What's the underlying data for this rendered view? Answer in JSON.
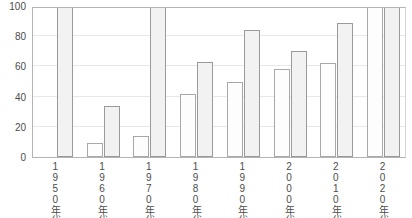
{
  "chart_data": {
    "type": "bar",
    "title": "",
    "subtitle": "",
    "xlabel": "",
    "ylabel": "",
    "ylim": [
      0,
      100
    ],
    "yticks": [
      0,
      20,
      40,
      60,
      80,
      100
    ],
    "grid": true,
    "legend": "none",
    "categories": [
      "1950年代",
      "1960年代",
      "1970年代",
      "1980年代",
      "1990年代",
      "2000年代",
      "2010年代",
      "2020年代"
    ],
    "series": [
      {
        "name": "series-a",
        "values": [
          null,
          9,
          14,
          42,
          50,
          58,
          62,
          100
        ]
      },
      {
        "name": "series-b",
        "values": [
          100,
          34,
          100,
          63,
          84,
          70,
          89,
          100
        ]
      }
    ]
  },
  "axis": {
    "y_tick_labels": [
      "100",
      "80",
      "60",
      "40",
      "20",
      "0"
    ]
  }
}
